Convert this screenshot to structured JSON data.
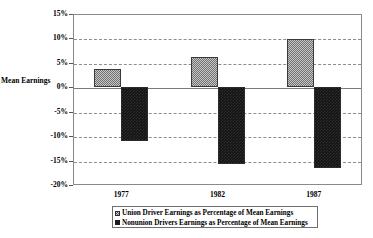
{
  "chart_data": {
    "type": "bar",
    "title": "",
    "subtitle": "",
    "xlabel": "",
    "ylabel": "Mean Earnings",
    "categories": [
      "1977",
      "1982",
      "1987"
    ],
    "ylim": [
      -20,
      15
    ],
    "ytick_labels": [
      "15%",
      "10%",
      "5%",
      "0%",
      "-5%",
      "-10%",
      "-15%",
      "-20%"
    ],
    "ytick_values": [
      15,
      10,
      5,
      0,
      -5,
      -10,
      -15,
      -20
    ],
    "grid": true,
    "grid_style": "dashed-horizontal",
    "legend_position": "bottom",
    "series": [
      {
        "name": "Union Driver Earnings as Percentage of Mean Earnings",
        "key": "union",
        "fill": "light-checker",
        "color": "#c9c9c9",
        "values": [
          3.8,
          6.3,
          9.8
        ]
      },
      {
        "name": "Nonunion Drivers Earnings as Percentage of Mean Earnings",
        "key": "nonunion",
        "fill": "solid-dark",
        "color": "#151515",
        "values": [
          -10.9,
          -15.8,
          -16.5
        ]
      }
    ]
  },
  "axis": {
    "y_title": "Mean Earnings"
  },
  "legend": {
    "items": [
      {
        "label": "Union Driver Earnings as Percentage of Mean Earnings",
        "swatch": "union"
      },
      {
        "label": "Nonunion Drivers Earnings as Percentage of Mean Earnings",
        "swatch": "nonunion"
      }
    ]
  }
}
